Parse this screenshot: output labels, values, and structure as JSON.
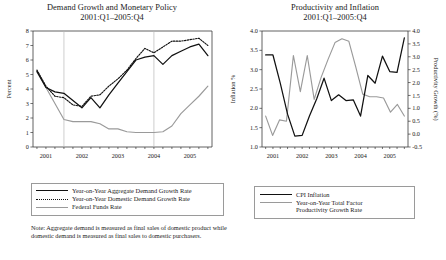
{
  "note": "Note: Aggregate demand is measured as final sales of domestic product while domestic demand is measured as final sales to domestic purchasers.",
  "left": {
    "title_line1": "Demand Growth and Monetary Policy",
    "title_line2": "2001:Q1–2005:Q4",
    "legend": [
      {
        "label": "Year-on-Year Aggregate Demand Growth Rate",
        "style": "solid"
      },
      {
        "label": "Year-on-Year Domestic Demand Growth Rate",
        "style": "dotted"
      },
      {
        "label": "Federal Funds Rate",
        "style": "gray"
      }
    ]
  },
  "right": {
    "title_line1": "Productivity and Inflation",
    "title_line2": "2001:Q1–2005:Q4",
    "legend": [
      {
        "label_1": "CPI Inflation",
        "label_2": "",
        "style": "solid"
      },
      {
        "label_1": "Year-on-Year Total Factor",
        "label_2": "Productivity Growth Rate",
        "style": "gray"
      }
    ]
  },
  "chart_data": [
    {
      "type": "line",
      "id": "demand-growth-and-monetary-policy",
      "title": "Demand Growth and Monetary Policy 2001:Q1–2005:Q4",
      "xlabel": "",
      "ylabel": "Percent",
      "ylim": [
        0,
        8
      ],
      "yticks": [
        0,
        1,
        2,
        3,
        4,
        5,
        6,
        7,
        8
      ],
      "xtick_labels": [
        "2001",
        "2002",
        "2003",
        "2004",
        "2005"
      ],
      "x": [
        "2001:Q1",
        "2001:Q2",
        "2001:Q3",
        "2001:Q4",
        "2002:Q1",
        "2002:Q2",
        "2002:Q3",
        "2002:Q4",
        "2003:Q1",
        "2003:Q2",
        "2003:Q3",
        "2003:Q4",
        "2004:Q1",
        "2004:Q2",
        "2004:Q3",
        "2004:Q4",
        "2005:Q1",
        "2005:Q2",
        "2005:Q3",
        "2005:Q4"
      ],
      "grid": false,
      "vertical_reference_lines": [
        "2001:Q4",
        "2004:Q2"
      ],
      "legend_position": "below",
      "series": [
        {
          "name": "Year-on-Year Aggregate Demand Growth Rate",
          "style": "solid",
          "color": "#111111",
          "values": [
            5.2,
            4.1,
            3.8,
            3.7,
            3.2,
            2.7,
            3.4,
            2.7,
            3.6,
            4.4,
            5.2,
            6.0,
            6.2,
            6.3,
            5.7,
            6.3,
            6.6,
            6.9,
            7.1,
            6.3
          ]
        },
        {
          "name": "Year-on-Year Domestic Demand Growth Rate",
          "style": "dotted",
          "color": "#111111",
          "values": [
            5.3,
            4.2,
            3.5,
            3.4,
            2.9,
            2.8,
            3.5,
            3.6,
            4.2,
            4.7,
            5.3,
            6.1,
            6.8,
            6.5,
            6.9,
            7.3,
            7.3,
            7.4,
            7.5,
            7.0
          ]
        },
        {
          "name": "Federal Funds Rate",
          "style": "gray",
          "color": "#9a9a9a",
          "values": [
            5.3,
            4.1,
            3.0,
            1.9,
            1.75,
            1.75,
            1.75,
            1.6,
            1.25,
            1.25,
            1.05,
            1.0,
            1.0,
            1.0,
            1.05,
            1.45,
            2.3,
            2.9,
            3.5,
            4.2
          ]
        }
      ]
    },
    {
      "type": "line",
      "id": "productivity-and-inflation",
      "title": "Productivity and Inflation 2001:Q1–2005:Q4",
      "xlabel": "",
      "ylabel": "Inflation %",
      "ylabel_secondary": "Productivity Growth (%)",
      "ylim": [
        1.0,
        4.0
      ],
      "yticks": [
        1.0,
        1.5,
        2.0,
        2.5,
        3.0,
        3.5,
        4.0
      ],
      "ylim_secondary": [
        -0.5,
        4.0
      ],
      "yticks_secondary": [
        -0.5,
        0.0,
        0.5,
        1.0,
        1.5,
        2.0,
        2.5,
        3.0,
        3.5,
        4.0
      ],
      "xtick_labels": [
        "2001",
        "2002",
        "2003",
        "2004",
        "2005"
      ],
      "x": [
        "2001:Q1",
        "2001:Q2",
        "2001:Q3",
        "2001:Q4",
        "2002:Q1",
        "2002:Q2",
        "2002:Q3",
        "2002:Q4",
        "2003:Q1",
        "2003:Q2",
        "2003:Q3",
        "2003:Q4",
        "2004:Q1",
        "2004:Q2",
        "2004:Q3",
        "2004:Q4",
        "2005:Q1",
        "2005:Q2",
        "2005:Q3",
        "2005:Q4"
      ],
      "grid": false,
      "legend_position": "below",
      "series": [
        {
          "name": "CPI Inflation",
          "style": "solid",
          "color": "#111111",
          "axis": "left",
          "values": [
            3.38,
            3.38,
            2.65,
            1.85,
            1.28,
            1.3,
            1.8,
            2.25,
            2.78,
            2.2,
            2.35,
            2.2,
            2.22,
            1.8,
            2.85,
            2.65,
            3.35,
            2.95,
            2.93,
            3.82
          ]
        },
        {
          "name": "Year-on-Year Total Factor Productivity Growth Rate",
          "style": "gray",
          "color": "#9a9a9a",
          "axis": "right",
          "values": [
            0.7,
            -0.05,
            0.55,
            0.5,
            3.05,
            1.65,
            3.05,
            1.35,
            2.2,
            2.9,
            3.55,
            3.7,
            3.6,
            2.6,
            1.55,
            1.45,
            1.45,
            1.4,
            0.85,
            1.15,
            0.7
          ]
        }
      ]
    }
  ]
}
